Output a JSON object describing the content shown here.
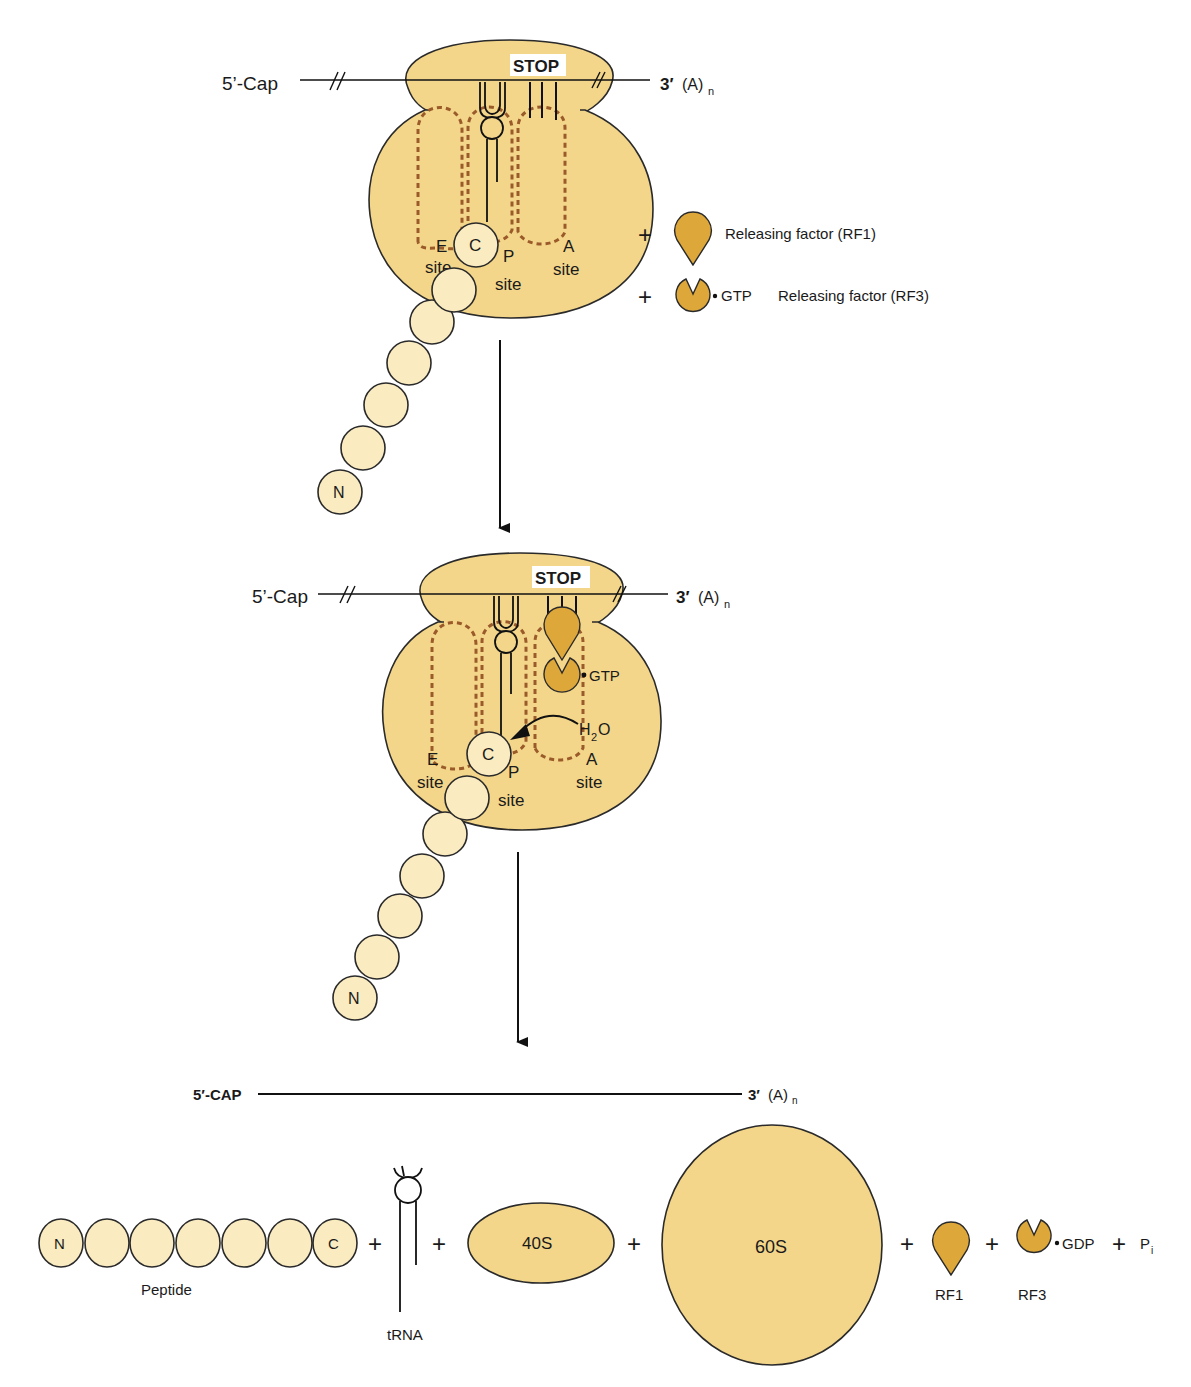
{
  "colors": {
    "ribosome_fill": "#f3d68a",
    "ribosome_stroke": "#2a2a2a",
    "amino_acid_fill": "#faebc0",
    "release_factor_fill": "#dea73a",
    "site_dash": "#9a5a2a",
    "line": "#111111",
    "background": "#ffffff"
  },
  "stage1": {
    "mrna_5_label": "5’-Cap",
    "mrna_3_label": "3′",
    "mrna_3_poly": "(A)",
    "mrna_3_sub": "n",
    "stop_label": "STOP",
    "c_terminus": "C",
    "n_terminus": "N",
    "e_site": [
      "E",
      "site"
    ],
    "p_site": [
      "P",
      "site"
    ],
    "a_site": [
      "A",
      "site"
    ],
    "reagents": [
      {
        "plus": "+",
        "icon": "rf1-icon",
        "label": "Releasing factor (RF1)"
      },
      {
        "plus": "+",
        "icon": "rf3-icon",
        "nucleotide": "GTP",
        "label": "Releasing factor (RF3)"
      }
    ]
  },
  "stage2": {
    "mrna_5_label": "5’-Cap",
    "mrna_3_label": "3′",
    "mrna_3_poly": "(A)",
    "mrna_3_sub": "n",
    "stop_label": "STOP",
    "gtp_label": "GTP",
    "water_h": "H",
    "water_sub": "2",
    "water_o": "O",
    "c_terminus": "C",
    "n_terminus": "N",
    "e_site": [
      "E",
      "site"
    ],
    "p_site": [
      "P",
      "site"
    ],
    "a_site": [
      "A",
      "site"
    ]
  },
  "stage3": {
    "mrna_5_label": "5′-CAP",
    "mrna_3_label": "3′",
    "mrna_3_poly": "(A)",
    "mrna_3_sub": "n",
    "peptide_n": "N",
    "peptide_c": "C",
    "peptide_label": "Peptide",
    "trna_label": "tRNA",
    "small_subunit": "40S",
    "large_subunit": "60S",
    "rf1_label": "RF1",
    "rf3_label": "RF3",
    "gdp_label": "GDP",
    "pi_p": "P",
    "pi_sub": "i",
    "plus": "+"
  }
}
